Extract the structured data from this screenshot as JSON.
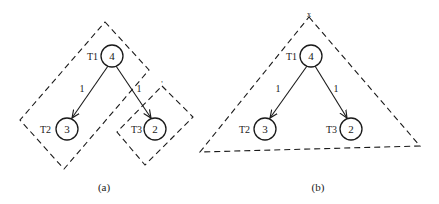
{
  "figure": {
    "panels": [
      {
        "id": "a",
        "caption": "(a)",
        "nodes": [
          {
            "id": "T1",
            "label": "T1",
            "value": "4"
          },
          {
            "id": "T2",
            "label": "T2",
            "value": "3"
          },
          {
            "id": "T3",
            "label": "T3",
            "value": "2"
          }
        ],
        "edges": [
          {
            "from": "T1",
            "to": "T2",
            "weight": "1"
          },
          {
            "from": "T1",
            "to": "T3",
            "weight": "1"
          }
        ],
        "regions": [
          {
            "shape": "dashed-diamond",
            "contains": [
              "T1",
              "T2"
            ]
          },
          {
            "shape": "dashed-diamond",
            "contains": [
              "T3"
            ],
            "apex_mark": "'"
          }
        ]
      },
      {
        "id": "b",
        "caption": "(b)",
        "nodes": [
          {
            "id": "T1",
            "label": "T1",
            "value": "4"
          },
          {
            "id": "T2",
            "label": "T2",
            "value": "3"
          },
          {
            "id": "T3",
            "label": "T3",
            "value": "2"
          }
        ],
        "edges": [
          {
            "from": "T1",
            "to": "T2",
            "weight": "1"
          },
          {
            "from": "T1",
            "to": "T3",
            "weight": "1"
          }
        ],
        "regions": [
          {
            "shape": "dashed-triangle",
            "contains": [
              "T1",
              "T2",
              "T3"
            ],
            "apex_mark": "x"
          }
        ]
      }
    ]
  }
}
